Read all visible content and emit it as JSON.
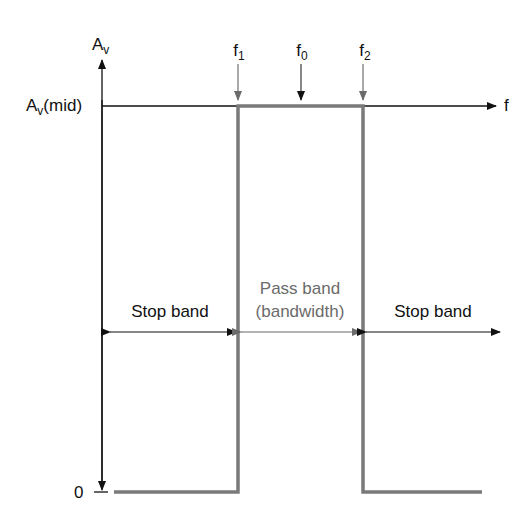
{
  "axes": {
    "y_label_main": "A",
    "y_label_sub": "v",
    "mid_label_main": "A",
    "mid_label_sub": "v",
    "mid_label_suffix": "(mid)",
    "zero_label": "0",
    "x_label": "f"
  },
  "markers": [
    {
      "main": "f",
      "sub": "1"
    },
    {
      "main": "f",
      "sub": "0"
    },
    {
      "main": "f",
      "sub": "2"
    }
  ],
  "regions": {
    "left_stop": "Stop band",
    "pass_line1": "Pass band",
    "pass_line2": "(bandwidth)",
    "right_stop": "Stop band"
  },
  "colors": {
    "axis": "#111111",
    "response": "#7a7a7a",
    "pass_text": "#6b6b6b"
  }
}
